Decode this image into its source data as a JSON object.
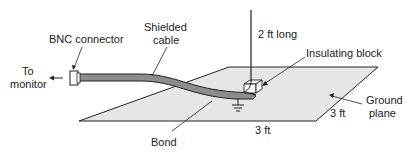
{
  "diagram": {
    "labels": {
      "bnc_connector": "BNC connector",
      "to_monitor_line1": "To",
      "to_monitor_line2": "monitor",
      "shielded_cable_line1": "Shielded",
      "shielded_cable_line2": "cable",
      "antenna_length": "2 ft long",
      "insulating_block": "Insulating block",
      "ground_plane_line1": "Ground",
      "ground_plane_line2": "plane",
      "dim_width": "3 ft",
      "dim_depth": "3 ft",
      "bond": "Bond"
    },
    "colors": {
      "plane_fill": "#e6e6e6",
      "cable_fill": "#8c8c8c",
      "line": "#222222"
    }
  }
}
